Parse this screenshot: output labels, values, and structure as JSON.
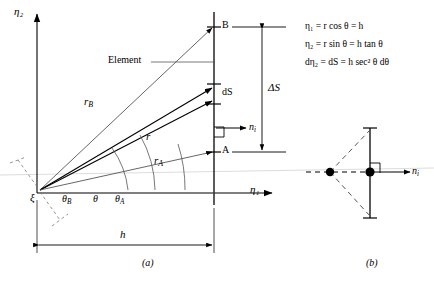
{
  "figure": {
    "panel_a": {
      "caption": "(a)",
      "axes": {
        "vertical_label": "η₂",
        "horizontal_label": "η₁"
      },
      "origin_label": "ξ",
      "annotations": {
        "element": "Element",
        "point_b": "B",
        "point_a": "A",
        "ds": "dS",
        "delta_s": "ΔS",
        "normal": "n",
        "normal_sub": "i",
        "h": "h"
      },
      "radii": [
        {
          "name": "r_B",
          "base": "r",
          "sub": "B"
        },
        {
          "name": "r",
          "base": "r",
          "sub": ""
        },
        {
          "name": "r_A",
          "base": "r",
          "sub": "A"
        }
      ],
      "angles": [
        {
          "name": "theta_B",
          "base": "θ",
          "sub": "B"
        },
        {
          "name": "theta",
          "base": "θ",
          "sub": ""
        },
        {
          "name": "theta_A",
          "base": "θ",
          "sub": "A"
        }
      ]
    },
    "panel_b": {
      "caption": "(b)",
      "normal": "n",
      "normal_sub": "i"
    },
    "equations": [
      {
        "id": "eq1",
        "text": "η₁ = r cos θ = h"
      },
      {
        "id": "eq2",
        "text": "η₂ = r sin θ = h tan θ"
      },
      {
        "id": "eq3",
        "text": "dη₂ = dS = h sec² θ dθ"
      }
    ]
  },
  "colors": {
    "line": "#000000",
    "thin": "#555555",
    "faint": "#cccccc"
  }
}
